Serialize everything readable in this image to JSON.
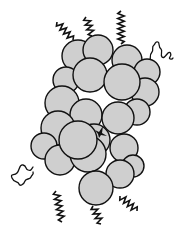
{
  "diagram": {
    "type": "molecular-cluster",
    "colors": {
      "sphere_fill": "#cfcfcf",
      "outline": "#111111",
      "background": "#ffffff"
    },
    "spheres": [
      {
        "cx": 78,
        "cy": 56,
        "r": 16
      },
      {
        "cx": 98,
        "cy": 50,
        "r": 15
      },
      {
        "cx": 127,
        "cy": 60,
        "r": 15
      },
      {
        "cx": 147,
        "cy": 72,
        "r": 13
      },
      {
        "cx": 66,
        "cy": 80,
        "r": 13
      },
      {
        "cx": 90,
        "cy": 75,
        "r": 17
      },
      {
        "cx": 145,
        "cy": 92,
        "r": 14
      },
      {
        "cx": 62,
        "cy": 103,
        "r": 17
      },
      {
        "cx": 86,
        "cy": 115,
        "r": 16
      },
      {
        "cx": 122,
        "cy": 82,
        "r": 18
      },
      {
        "cx": 137,
        "cy": 112,
        "r": 13
      },
      {
        "cx": 94,
        "cy": 140,
        "r": 16
      },
      {
        "cx": 58,
        "cy": 128,
        "r": 17
      },
      {
        "cx": 118,
        "cy": 118,
        "r": 16
      },
      {
        "cx": 44,
        "cy": 146,
        "r": 13
      },
      {
        "cx": 124,
        "cy": 148,
        "r": 14
      },
      {
        "cx": 133,
        "cy": 166,
        "r": 11
      },
      {
        "cx": 60,
        "cy": 160,
        "r": 15
      },
      {
        "cx": 88,
        "cy": 154,
        "r": 18
      },
      {
        "cx": 120,
        "cy": 174,
        "r": 14
      },
      {
        "cx": 96,
        "cy": 188,
        "r": 17
      },
      {
        "cx": 78,
        "cy": 140,
        "r": 19
      }
    ],
    "core_point": {
      "cx": 100,
      "cy": 133
    },
    "coils": [
      {
        "position": "top-left",
        "x1": 57,
        "y1": 22,
        "x2": 73,
        "y2": 40
      },
      {
        "position": "top-middle",
        "x1": 86,
        "y1": 17,
        "x2": 92,
        "y2": 36
      },
      {
        "position": "top-right",
        "x1": 121,
        "y1": 11,
        "x2": 121,
        "y2": 44
      },
      {
        "position": "bottom-left",
        "x1": 56,
        "y1": 191,
        "x2": 62,
        "y2": 222
      },
      {
        "position": "bottom-middle",
        "x1": 93,
        "y1": 206,
        "x2": 101,
        "y2": 224
      },
      {
        "position": "bottom-right",
        "x1": 120,
        "y1": 196,
        "x2": 137,
        "y2": 211
      }
    ],
    "chains": [
      {
        "position": "right-top"
      },
      {
        "position": "left-bottom"
      }
    ]
  }
}
